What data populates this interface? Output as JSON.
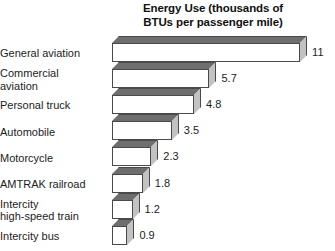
{
  "chart_data": {
    "type": "bar",
    "orientation": "horizontal",
    "title": "Energy Use (thousands of BTUs per passenger mile)",
    "title_lines": [
      "Energy Use (thousands of",
      "BTUs per passenger mile)"
    ],
    "xlabel": "",
    "ylabel": "",
    "xlim": [
      0,
      11
    ],
    "grid": false,
    "legend": false,
    "style": "3d-bars",
    "categories": [
      "General aviation",
      "Commercial aviation",
      "Personal truck",
      "Automobile",
      "Motorcycle",
      "AMTRAK railroad",
      "Intercity high-speed train",
      "Intercity bus"
    ],
    "values": [
      11,
      5.7,
      4.8,
      3.5,
      2.3,
      1.8,
      1.2,
      0.9
    ],
    "value_labels": [
      "11",
      "5.7",
      "4.8",
      "3.5",
      "2.3",
      "1.8",
      "1.2",
      "0.9"
    ],
    "category_label_lines": [
      [
        "General aviation"
      ],
      [
        "Commercial",
        "aviation"
      ],
      [
        "Personal truck"
      ],
      [
        "Automobile"
      ],
      [
        "Motorcycle"
      ],
      [
        "AMTRAK railroad"
      ],
      [
        "Intercity",
        "high-speed train"
      ],
      [
        "Intercity bus"
      ]
    ],
    "units": "thousands of BTUs per passenger mile"
  },
  "colors": {
    "bar_front": "#ffffff",
    "bar_top": "#6e6e6e",
    "bar_side": "#c2c2c2",
    "bar_outline": "#4a4a4a",
    "text": "#1c1c1c",
    "title_text": "#111111",
    "background": "#ffffff"
  }
}
